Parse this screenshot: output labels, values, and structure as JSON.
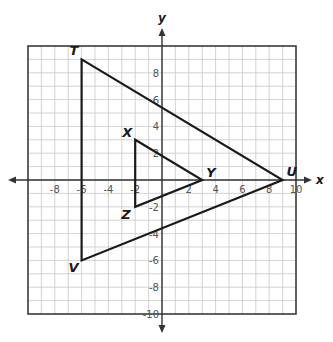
{
  "diagram": {
    "type": "coordinate-plane",
    "axis_labels": {
      "x": "x",
      "y": "y"
    },
    "range": {
      "xmin": -10,
      "xmax": 10,
      "ymin": -10,
      "ymax": 10
    },
    "x_tick_labels": [
      "-8",
      "-6",
      "-4",
      "-2",
      "2",
      "4",
      "6",
      "8",
      "10"
    ],
    "x_tick_values": [
      -8,
      -6,
      -4,
      -2,
      2,
      4,
      6,
      8,
      10
    ],
    "y_tick_labels": [
      "8",
      "6",
      "4",
      "2",
      "-2",
      "-4",
      "-6",
      "-8",
      "-10"
    ],
    "y_tick_values": [
      8,
      6,
      4,
      2,
      -2,
      -4,
      -6,
      -8,
      -10
    ],
    "triangles": [
      {
        "name": "TUV",
        "vertices": [
          {
            "label": "T",
            "x": -6,
            "y": 9
          },
          {
            "label": "U",
            "x": 9,
            "y": 0
          },
          {
            "label": "V",
            "x": -6,
            "y": -6
          }
        ]
      },
      {
        "name": "XYZ",
        "vertices": [
          {
            "label": "X",
            "x": -2,
            "y": 3
          },
          {
            "label": "Y",
            "x": 3,
            "y": 0
          },
          {
            "label": "Z",
            "x": -2,
            "y": -2
          }
        ]
      }
    ],
    "colors": {
      "grid": "#c8c8c8",
      "border": "#333333",
      "axis": "#333333",
      "shape": "#1a1a1a"
    }
  }
}
